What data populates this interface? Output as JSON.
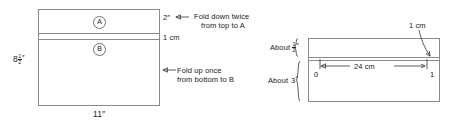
{
  "diagram": {
    "left_figure": {
      "name": "unfolded-sheet",
      "region_a_label": "A",
      "region_b_label": "B",
      "height_label": {
        "whole": "8",
        "numerator": "1",
        "denominator": "2",
        "unit": "″"
      },
      "width_label": "11″",
      "top_strip_label": "2″",
      "middle_strip_label": "1 cm",
      "annotations": [
        {
          "line1": "Fold down twice",
          "line2": "from top to A"
        },
        {
          "line1": "Fold up once",
          "line2": "from bottom to B"
        }
      ]
    },
    "right_figure": {
      "name": "folded-strip-ruler",
      "top_brace_label": {
        "prefix": "About",
        "numerator": "1",
        "denominator": "2",
        "unit": "″"
      },
      "bottom_brace_label": {
        "prefix": "About",
        "value": "3",
        "unit": "″"
      },
      "callout_label": "1 cm",
      "scale_label": "24 cm",
      "tick_start": "0",
      "tick_end": "1"
    },
    "colors": {
      "background": "#ffffff",
      "stroke": "#8a8a8a",
      "arrow": "#4a4a4a",
      "text": "#1a1a1a"
    }
  }
}
